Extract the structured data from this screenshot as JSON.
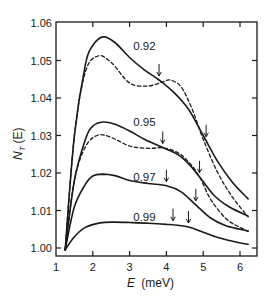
{
  "chart_data": {
    "type": "line",
    "title": "",
    "xlabel": "E (meV)",
    "ylabel": "N_T (E)",
    "xlim": [
      0.95,
      6.46
    ],
    "ylim": [
      0.9979,
      1.06
    ],
    "xticks": [
      1,
      2,
      3,
      4,
      5,
      6
    ],
    "yticks": [
      1.0,
      1.01,
      1.02,
      1.03,
      1.04,
      1.05,
      1.06
    ],
    "ytick_labels": [
      "1.00",
      "1.01",
      "1.02",
      "1.03",
      "1.04",
      "1.05",
      "1.06"
    ],
    "grid": false,
    "legend": "inline labels on curves",
    "series": [
      {
        "name": "0.92",
        "style": "solid",
        "x": [
          1.25,
          1.5,
          1.8,
          2.0,
          2.28,
          2.6,
          3.0,
          3.4,
          3.8,
          4.2,
          4.6,
          5.0,
          5.4,
          5.8,
          6.22
        ],
        "y": [
          0.9995,
          1.03,
          1.049,
          1.054,
          1.0563,
          1.0548,
          1.0508,
          1.0475,
          1.0448,
          1.0415,
          1.037,
          1.03,
          1.023,
          1.0175,
          1.0131
        ],
        "arrows": [
          3.8,
          5.08
        ],
        "label_pos": [
          3.1,
          1.0528
        ]
      },
      {
        "name": "0.92 (dashed)",
        "style": "dashed",
        "x": [
          1.25,
          1.5,
          1.8,
          2.14,
          2.5,
          3.0,
          3.5,
          3.9,
          4.1,
          4.4,
          4.7,
          5.0,
          5.4,
          5.8,
          6.22
        ],
        "y": [
          0.9995,
          1.03,
          1.047,
          1.0512,
          1.0495,
          1.044,
          1.0432,
          1.0443,
          1.0448,
          1.043,
          1.037,
          1.029,
          1.02,
          1.0135,
          1.0083
        ]
      },
      {
        "name": "0.95",
        "style": "solid",
        "x": [
          1.25,
          1.5,
          1.8,
          2.0,
          2.28,
          2.6,
          3.0,
          3.4,
          3.9,
          4.3,
          4.6,
          4.9,
          5.3,
          5.7,
          6.22
        ],
        "y": [
          0.9995,
          1.018,
          1.029,
          1.0325,
          1.0336,
          1.033,
          1.0312,
          1.029,
          1.0268,
          1.025,
          1.0225,
          1.019,
          1.014,
          1.011,
          1.0085
        ],
        "arrows": [
          3.9,
          4.9
        ],
        "label_pos": [
          3.1,
          1.0326
        ]
      },
      {
        "name": "0.95 (dashed)",
        "style": "dashed",
        "x": [
          1.25,
          1.5,
          1.8,
          2.14,
          2.5,
          3.0,
          3.5,
          3.9,
          4.3,
          4.6,
          4.9,
          5.2,
          5.6,
          5.9,
          6.22
        ],
        "y": [
          0.9995,
          1.018,
          1.027,
          1.0301,
          1.0295,
          1.0272,
          1.0266,
          1.0267,
          1.0255,
          1.023,
          1.019,
          1.013,
          1.008,
          1.006,
          1.0045
        ]
      },
      {
        "name": "0.97",
        "style": "solid",
        "x": [
          1.25,
          1.5,
          1.8,
          2.0,
          2.27,
          2.6,
          3.0,
          3.5,
          4.0,
          4.4,
          4.8,
          5.2,
          5.6,
          6.0,
          6.22
        ],
        "y": [
          0.9995,
          1.011,
          1.017,
          1.0192,
          1.0197,
          1.0193,
          1.018,
          1.0172,
          1.0166,
          1.015,
          1.0115,
          1.008,
          1.006,
          1.005,
          1.0045
        ]
      },
      {
        "name": "0.99",
        "style": "solid",
        "x": [
          1.25,
          1.5,
          1.8,
          2.2,
          2.6,
          3.0,
          3.5,
          4.0,
          4.18,
          4.6,
          5.0,
          5.4,
          5.8,
          6.22
        ],
        "y": [
          0.9995,
          1.003,
          1.0055,
          1.0067,
          1.0069,
          1.0068,
          1.0066,
          1.0063,
          1.0062,
          1.0056,
          1.0042,
          1.0028,
          1.0018,
          1.001
        ],
        "arrows": [
          4.18,
          4.6
        ],
        "label_pos": [
          3.1,
          1.0072
        ]
      }
    ],
    "annotations": [
      {
        "text": "0.92",
        "x": 3.1,
        "y": 1.0528
      },
      {
        "text": "0.95",
        "x": 3.1,
        "y": 1.0326
      },
      {
        "text": "0.97",
        "x": 3.1,
        "y": 1.0178
      },
      {
        "text": "0.99",
        "x": 3.1,
        "y": 1.0072
      }
    ],
    "arrow_markers": [
      {
        "series": "0.92",
        "x": [
          3.8,
          5.08
        ]
      },
      {
        "series": "0.95",
        "x": [
          3.9,
          4.9
        ]
      },
      {
        "series": "0.97",
        "x": [
          4.0,
          4.8
        ]
      },
      {
        "series": "0.99",
        "x": [
          4.18,
          4.6
        ]
      }
    ]
  },
  "labels": {
    "xlabel_main": "E",
    "xlabel_unit": "(meV)",
    "ylabel_main": "N",
    "ylabel_sub": "T",
    "ylabel_arg": "(E)"
  }
}
